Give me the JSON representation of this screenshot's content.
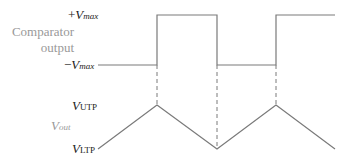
{
  "diagram": {
    "comparator_label_line1": "Comparator",
    "comparator_label_line2": "output",
    "vmax_pos": {
      "prefix": "+",
      "var": "V",
      "sub": "max"
    },
    "vmax_neg": {
      "prefix": "−",
      "var": "V",
      "sub": "max"
    },
    "vout": {
      "var": "V",
      "sub": "out"
    },
    "vutp": {
      "var": "V",
      "sub": "UTP"
    },
    "vltp": {
      "var": "V",
      "sub": "LTP"
    },
    "colors": {
      "line": "#7a7a7a",
      "label": "#222222",
      "muted_label": "#999999"
    },
    "square_wave": {
      "high_y": 15,
      "low_y": 65,
      "transitions_x": [
        157,
        217,
        276
      ],
      "start_x": 98,
      "end_x": 335
    },
    "triangle_wave": {
      "points": [
        [
          98,
          149
        ],
        [
          157,
          105
        ],
        [
          217,
          149
        ],
        [
          276,
          105
        ],
        [
          335,
          149
        ]
      ]
    }
  }
}
